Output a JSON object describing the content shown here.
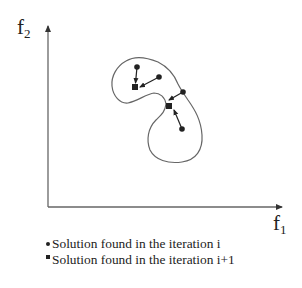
{
  "axes": {
    "x_label": "f",
    "x_subscript": "1",
    "y_label": "f",
    "y_subscript": "2"
  },
  "legend": {
    "items": [
      {
        "marker": "circle",
        "label": "Solution found in the iteration i"
      },
      {
        "marker": "square",
        "label": "Solution found in the iteration i+1"
      }
    ]
  },
  "diagram": {
    "circles": [
      {
        "x": 137,
        "y": 67
      },
      {
        "x": 159,
        "y": 77
      },
      {
        "x": 183,
        "y": 92
      },
      {
        "x": 182,
        "y": 129
      }
    ],
    "squares": [
      {
        "x": 135,
        "y": 87
      },
      {
        "x": 169,
        "y": 106
      }
    ],
    "arrows": [
      {
        "from": [
          137,
          67
        ],
        "to": [
          135,
          84
        ]
      },
      {
        "from": [
          159,
          77
        ],
        "to": [
          139,
          87
        ]
      },
      {
        "from": [
          183,
          92
        ],
        "to": [
          170,
          100
        ]
      },
      {
        "from": [
          182,
          129
        ],
        "to": [
          173,
          110
        ]
      }
    ],
    "colors": {
      "ink": "#222222",
      "outline": "#555555",
      "axis": "#555555"
    }
  }
}
